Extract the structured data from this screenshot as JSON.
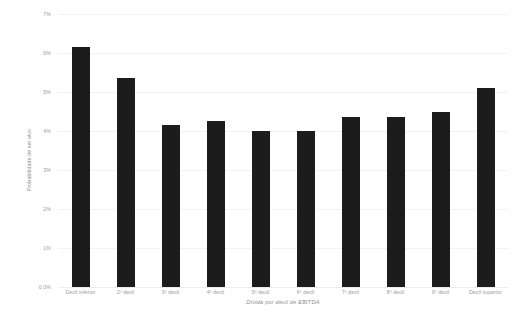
{
  "chart_data": {
    "type": "bar",
    "title": "",
    "subtitle": "",
    "xlabel": "Dívida por decil de EBITDA",
    "ylabel": "Probabilidade de ser alvo",
    "categories": [
      "Decil inferior",
      "2º decil",
      "3º decil",
      "4º decil",
      "5º decil",
      "6º decil",
      "7º decil",
      "8º decil",
      "9º decil",
      "Decil superior"
    ],
    "values": [
      6.15,
      5.35,
      4.15,
      4.25,
      4.0,
      4.0,
      4.35,
      4.35,
      4.5,
      5.1
    ],
    "value_unit": "%",
    "ylim": [
      0,
      7
    ],
    "ytick_values": [
      0,
      1,
      2,
      3,
      4,
      5,
      6,
      7
    ],
    "ytick_labels": [
      "0.0%",
      "1%",
      "2%",
      "3%",
      "4%",
      "5%",
      "6%",
      "7%"
    ],
    "grid": true,
    "grid_axis": "y",
    "legend": false,
    "legend_position": "none",
    "bar_color": "#1c1c1c",
    "background_color": "#ffffff",
    "axis_text_color": "#9a9a9a",
    "gridline_color": "#f2f2f2"
  }
}
